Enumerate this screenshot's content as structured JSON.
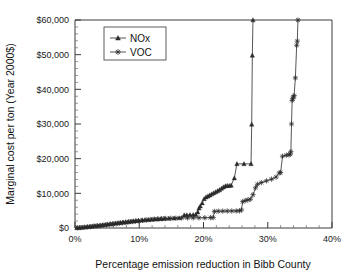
{
  "chart_data": {
    "type": "line",
    "title": "",
    "xlabel": "Percentage emission reduction in Bibb County",
    "ylabel": "Marginal cost per ton (Year 2000$)",
    "xlim": [
      0,
      40
    ],
    "ylim": [
      0,
      60000
    ],
    "xticks": [
      0,
      10,
      20,
      30,
      40
    ],
    "xticklabels": [
      "0%",
      "10%",
      "20%",
      "30%",
      "40%"
    ],
    "yticks": [
      0,
      10000,
      20000,
      30000,
      40000,
      50000,
      60000
    ],
    "yticklabels": [
      "$0",
      "$10,000",
      "$20,000",
      "$30,000",
      "$40,000",
      "$50,000",
      "$60,000"
    ],
    "x_minor_step": 2,
    "y_minor_step": 2000,
    "grid": false,
    "legend_position": "upper-left-inside",
    "series": [
      {
        "name": "NOx",
        "marker": "triangle",
        "color": "#2b2b2b",
        "points": [
          [
            0.3,
            60
          ],
          [
            0.7,
            110
          ],
          [
            1.1,
            180
          ],
          [
            1.5,
            250
          ],
          [
            1.9,
            330
          ],
          [
            2.3,
            420
          ],
          [
            2.7,
            520
          ],
          [
            3.1,
            610
          ],
          [
            3.5,
            700
          ],
          [
            3.9,
            790
          ],
          [
            4.3,
            880
          ],
          [
            4.7,
            980
          ],
          [
            5.1,
            1080
          ],
          [
            5.5,
            1180
          ],
          [
            5.9,
            1280
          ],
          [
            6.3,
            1380
          ],
          [
            6.7,
            1470
          ],
          [
            7.1,
            1560
          ],
          [
            7.5,
            1650
          ],
          [
            7.9,
            1740
          ],
          [
            8.3,
            1830
          ],
          [
            8.7,
            1920
          ],
          [
            9.1,
            2000
          ],
          [
            9.5,
            2080
          ],
          [
            9.9,
            2160
          ],
          [
            10.4,
            2240
          ],
          [
            10.9,
            2310
          ],
          [
            11.4,
            2380
          ],
          [
            11.9,
            2450
          ],
          [
            12.4,
            2520
          ],
          [
            12.9,
            2580
          ],
          [
            13.4,
            2640
          ],
          [
            13.9,
            2700
          ],
          [
            14.6,
            2760
          ],
          [
            15.4,
            2820
          ],
          [
            16.2,
            2880
          ],
          [
            17.0,
            3700
          ],
          [
            17.4,
            3750
          ],
          [
            17.9,
            3790
          ],
          [
            18.4,
            3820
          ],
          [
            18.8,
            3850
          ],
          [
            19.1,
            4600
          ],
          [
            19.3,
            5700
          ],
          [
            19.5,
            6300
          ],
          [
            19.8,
            7200
          ],
          [
            20.1,
            8400
          ],
          [
            20.4,
            8900
          ],
          [
            20.7,
            9200
          ],
          [
            21.0,
            9500
          ],
          [
            21.3,
            9800
          ],
          [
            21.6,
            10100
          ],
          [
            21.9,
            10400
          ],
          [
            22.2,
            10700
          ],
          [
            22.5,
            11000
          ],
          [
            22.8,
            11400
          ],
          [
            23.1,
            11800
          ],
          [
            23.4,
            12100
          ],
          [
            23.7,
            12200
          ],
          [
            24.0,
            12200
          ],
          [
            24.3,
            12300
          ],
          [
            24.8,
            14400
          ],
          [
            25.2,
            18500
          ],
          [
            26.3,
            18500
          ],
          [
            27.4,
            18500
          ],
          [
            27.5,
            29900
          ],
          [
            27.6,
            49800
          ],
          [
            27.7,
            60000
          ]
        ]
      },
      {
        "name": "VOC",
        "marker": "star",
        "color": "#2b2b2b",
        "points": [
          [
            0.4,
            50
          ],
          [
            0.9,
            120
          ],
          [
            1.4,
            200
          ],
          [
            1.9,
            290
          ],
          [
            2.4,
            380
          ],
          [
            2.9,
            470
          ],
          [
            3.4,
            560
          ],
          [
            3.9,
            650
          ],
          [
            4.4,
            760
          ],
          [
            4.9,
            880
          ],
          [
            5.4,
            1000
          ],
          [
            5.9,
            1120
          ],
          [
            6.4,
            1240
          ],
          [
            6.9,
            1360
          ],
          [
            7.4,
            1480
          ],
          [
            7.9,
            1600
          ],
          [
            8.4,
            1720
          ],
          [
            8.9,
            1840
          ],
          [
            9.4,
            1960
          ],
          [
            9.9,
            2080
          ],
          [
            10.5,
            2200
          ],
          [
            11.1,
            2320
          ],
          [
            11.7,
            2440
          ],
          [
            12.3,
            2560
          ],
          [
            12.9,
            2640
          ],
          [
            13.5,
            2700
          ],
          [
            14.1,
            2760
          ],
          [
            14.9,
            2800
          ],
          [
            15.7,
            2840
          ],
          [
            16.6,
            2880
          ],
          [
            17.5,
            2900
          ],
          [
            18.4,
            2920
          ],
          [
            19.3,
            2940
          ],
          [
            20.2,
            2960
          ],
          [
            21.1,
            2980
          ],
          [
            21.5,
            3000
          ],
          [
            21.7,
            4800
          ],
          [
            22.3,
            4850
          ],
          [
            23.0,
            4870
          ],
          [
            23.7,
            4890
          ],
          [
            24.4,
            4910
          ],
          [
            25.1,
            4930
          ],
          [
            25.6,
            4950
          ],
          [
            25.9,
            5200
          ],
          [
            26.1,
            7600
          ],
          [
            26.5,
            7900
          ],
          [
            26.9,
            8100
          ],
          [
            27.3,
            8300
          ],
          [
            27.7,
            9600
          ],
          [
            28.1,
            11600
          ],
          [
            28.4,
            12600
          ],
          [
            29.0,
            13100
          ],
          [
            29.8,
            13600
          ],
          [
            30.6,
            14100
          ],
          [
            31.3,
            14700
          ],
          [
            31.8,
            15900
          ],
          [
            32.0,
            16000
          ],
          [
            32.3,
            20700
          ],
          [
            32.9,
            21000
          ],
          [
            33.3,
            21100
          ],
          [
            33.5,
            21300
          ],
          [
            33.6,
            22000
          ],
          [
            33.7,
            30000
          ],
          [
            33.8,
            36800
          ],
          [
            33.9,
            37300
          ],
          [
            34.0,
            37800
          ],
          [
            34.1,
            38200
          ],
          [
            34.3,
            43300
          ],
          [
            34.5,
            52700
          ],
          [
            34.6,
            53900
          ],
          [
            34.7,
            60000
          ]
        ]
      }
    ]
  },
  "legend": {
    "entries": [
      {
        "label": "NOx",
        "marker": "triangle"
      },
      {
        "label": "VOC",
        "marker": "star"
      }
    ]
  }
}
